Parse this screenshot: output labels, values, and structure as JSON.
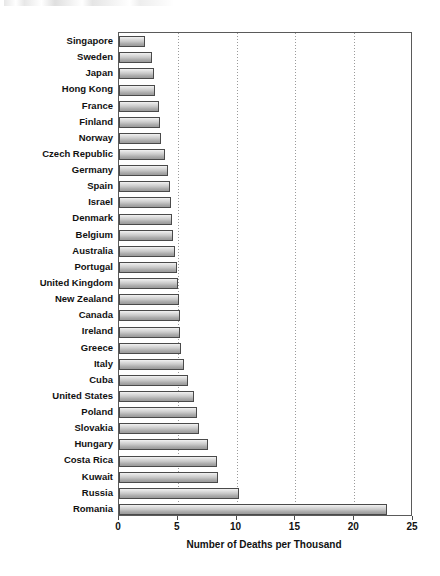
{
  "chart_data": {
    "type": "bar",
    "orientation": "horizontal",
    "title": "",
    "xlabel": "Number of Deaths per Thousand",
    "ylabel": "",
    "xlim": [
      0,
      25
    ],
    "xticks": [
      0,
      5,
      10,
      15,
      20,
      25
    ],
    "gridlines": {
      "x": [
        5,
        10,
        15,
        20
      ],
      "style": "dotted",
      "y": false
    },
    "legend": null,
    "categories": [
      "Singapore",
      "Sweden",
      "Japan",
      "Hong Kong",
      "France",
      "Finland",
      "Norway",
      "Czech Republic",
      "Germany",
      "Spain",
      "Israel",
      "Denmark",
      "Belgium",
      "Australia",
      "Portugal",
      "United Kingdom",
      "New Zealand",
      "Canada",
      "Ireland",
      "Greece",
      "Italy",
      "Cuba",
      "United States",
      "Poland",
      "Slovakia",
      "Hungary",
      "Costa Rica",
      "Kuwait",
      "Russia",
      "Romania"
    ],
    "values": [
      2.2,
      2.8,
      3.0,
      3.1,
      3.4,
      3.5,
      3.6,
      3.9,
      4.2,
      4.3,
      4.4,
      4.5,
      4.6,
      4.8,
      4.9,
      5.0,
      5.1,
      5.2,
      5.2,
      5.3,
      5.5,
      5.9,
      6.4,
      6.6,
      6.8,
      7.6,
      8.3,
      8.4,
      10.2,
      22.8
    ]
  },
  "axis": {
    "x_tick_labels": [
      "0",
      "5",
      "10",
      "15",
      "20",
      "25"
    ],
    "x_title": "Number of Deaths per Thousand"
  }
}
